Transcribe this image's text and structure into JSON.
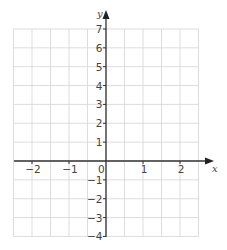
{
  "chart_data": {
    "type": "scatter",
    "title": "",
    "xlabel": "x",
    "ylabel": "y",
    "xlim": [
      -2.5,
      2.5
    ],
    "ylim": [
      -4,
      7
    ],
    "x_ticks": [
      -2,
      -1,
      0,
      1,
      2
    ],
    "x_tick_labels": [
      "−2",
      "−1",
      "0",
      "1",
      "2"
    ],
    "y_ticks": [
      -4,
      -3,
      -2,
      -1,
      1,
      2,
      3,
      4,
      5,
      6,
      7
    ],
    "y_tick_labels": [
      "−4",
      "−3",
      "−2",
      "−1",
      "1",
      "2",
      "3",
      "4",
      "5",
      "6",
      "7"
    ],
    "origin_label": "0",
    "grid": true,
    "grid_step": 0.5,
    "series": [],
    "legend": null
  },
  "colors": {
    "grid": "#d4d4d4",
    "axis": "#333333",
    "labels": "#444444",
    "background": "#ffffff"
  }
}
